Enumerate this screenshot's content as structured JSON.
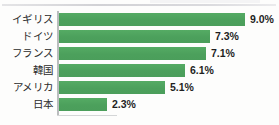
{
  "chart_data": {
    "type": "bar",
    "orientation": "horizontal",
    "title": "",
    "subtitle": "",
    "xlabel": "",
    "ylabel": "",
    "categories": [
      "イギリス",
      "ドイツ",
      "フランス",
      "韓国",
      "アメリカ",
      "日本"
    ],
    "values": [
      9.0,
      7.3,
      7.1,
      6.1,
      5.1,
      2.3
    ],
    "value_labels": [
      "9.0%",
      "7.3%",
      "7.1%",
      "6.1%",
      "5.1%",
      "2.3%"
    ],
    "unit": "%",
    "xlim": [
      0,
      9.0
    ],
    "grid": false,
    "legend": null,
    "series": [
      {
        "name": "",
        "values": [
          9.0,
          7.3,
          7.1,
          6.1,
          5.1,
          2.3
        ]
      }
    ],
    "colors": {
      "bar": "#4fa55f",
      "axis": "#b9bcbd",
      "label_text": "#2b2b2b",
      "value_text": "#1f1f1f",
      "background": "#fdfdfc"
    }
  },
  "rows": [
    {
      "category": "イギリス",
      "value_label": "9.0%",
      "bar_width_px": 186
    },
    {
      "category": "ドイツ",
      "value_label": "7.3%",
      "bar_width_px": 151
    },
    {
      "category": "フランス",
      "value_label": "7.1%",
      "bar_width_px": 147
    },
    {
      "category": "韓国",
      "value_label": "6.1%",
      "bar_width_px": 126
    },
    {
      "category": "アメリカ",
      "value_label": "5.1%",
      "bar_width_px": 106
    },
    {
      "category": "日本",
      "value_label": "2.3%",
      "bar_width_px": 48
    }
  ]
}
